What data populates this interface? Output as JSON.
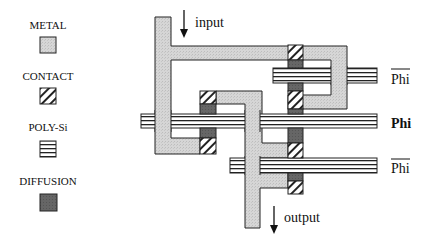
{
  "legend": {
    "items": [
      {
        "label": "METAL",
        "swatch": "metal"
      },
      {
        "label": "CONTACT",
        "swatch": "contact"
      },
      {
        "label": "POLY-Si",
        "swatch": "poly"
      },
      {
        "label": "DIFFUSION",
        "swatch": "diffusion"
      }
    ]
  },
  "diagram": {
    "input_label": "input",
    "output_label": "output",
    "signals": [
      {
        "label": "Phi",
        "overbar": true,
        "bold": false
      },
      {
        "label": "Phi",
        "overbar": false,
        "bold": true
      },
      {
        "label": "Phi",
        "overbar": true,
        "bold": false
      }
    ]
  },
  "colors": {
    "metal": "#d4d4d4",
    "diffusion": "#6a6a6a",
    "stroke": "#222222",
    "background": "#ffffff"
  }
}
